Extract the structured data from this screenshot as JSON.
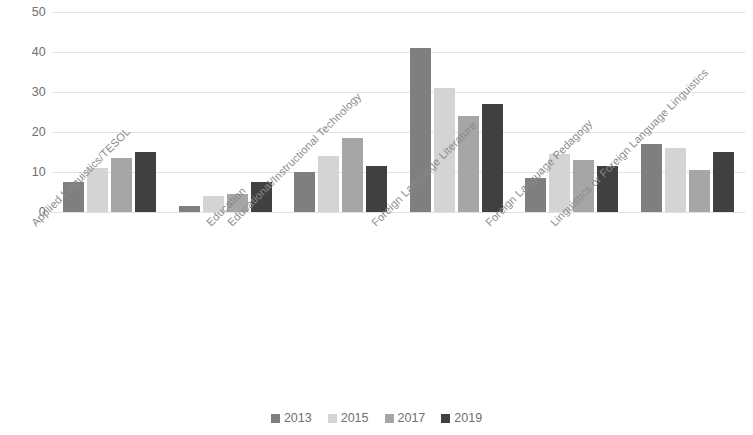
{
  "chart_data": {
    "type": "bar",
    "title": "",
    "subtitle": "",
    "xlabel": "",
    "ylabel": "",
    "ylim": [
      0,
      50
    ],
    "y_ticks": [
      "0",
      "10",
      "20",
      "30",
      "40",
      "50"
    ],
    "grid": true,
    "legend_position": "bottom",
    "categories": [
      "Applied Linguistics/TESOL",
      "Education",
      "Educational/Instructional Technology",
      "Foreign Language Literature",
      "Foreign Language Pedagogy",
      "Linguistics or Foreign Language Linguistics"
    ],
    "series": [
      {
        "name": "2013",
        "color": "#7f7f7f",
        "values": [
          7.5,
          1.5,
          10,
          41,
          8.5,
          17
        ]
      },
      {
        "name": "2015",
        "color": "#d4d4d4",
        "values": [
          11,
          4,
          14,
          31,
          14.5,
          16
        ]
      },
      {
        "name": "2017",
        "color": "#a6a6a6",
        "values": [
          13.5,
          4.5,
          18.5,
          24,
          13,
          10.5
        ]
      },
      {
        "name": "2019",
        "color": "#404040",
        "values": [
          15,
          7.5,
          11.5,
          27,
          11.5,
          15
        ]
      }
    ]
  },
  "colors": {
    "gridline": "#e2e2e2",
    "tick_text": "#6f6f6f",
    "category_text": "#8a8a8a",
    "background": "#ffffff"
  }
}
